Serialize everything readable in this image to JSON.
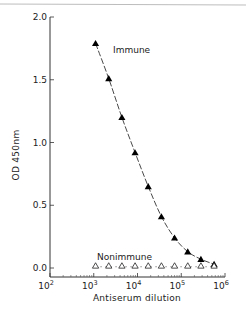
{
  "chart_data": {
    "type": "line",
    "title": "",
    "xlabel": "Antiserum dilution",
    "ylabel": "OD 450nm",
    "xscale": "log",
    "xlim": [
      100,
      1000000
    ],
    "ylim": [
      0.0,
      2.0
    ],
    "x_ticks": [
      100,
      1000,
      10000,
      100000,
      1000000
    ],
    "x_tick_labels": [
      {
        "base": "10",
        "exp": "2"
      },
      {
        "base": "10",
        "exp": "3"
      },
      {
        "base": "10",
        "exp": "4"
      },
      {
        "base": "10",
        "exp": "5"
      },
      {
        "base": "10",
        "exp": "6"
      }
    ],
    "y_ticks": [
      0.0,
      0.5,
      1.0,
      1.5,
      2.0
    ],
    "y_tick_labels": [
      "0.0",
      "0.5",
      "1.0",
      "1.5",
      "2.0"
    ],
    "grid": false,
    "legend": "inline labels",
    "x": [
      1100,
      2200,
      4400,
      8800,
      17600,
      35200,
      70400,
      140800,
      281600,
      563200
    ],
    "series": [
      {
        "name": "Immune",
        "marker": "filled-triangle",
        "line": "dashed",
        "values": [
          1.79,
          1.51,
          1.2,
          0.92,
          0.65,
          0.41,
          0.24,
          0.13,
          0.07,
          0.03
        ]
      },
      {
        "name": "Nonimmune",
        "marker": "open-triangle",
        "line": "dotted",
        "values": [
          0.01,
          0.01,
          0.01,
          0.01,
          0.01,
          0.01,
          0.01,
          0.01,
          0.01,
          0.01
        ]
      }
    ],
    "annotations": [
      "Immune",
      "Nonimmune"
    ]
  },
  "layout": {
    "plot": {
      "x0": 50,
      "x1": 225,
      "y_axis_bottom": 277,
      "y_top_px": 17,
      "y_zero_px": 268
    },
    "colors": {
      "ink": "#000000",
      "axis": "#333333",
      "background": "#ffffff"
    }
  }
}
